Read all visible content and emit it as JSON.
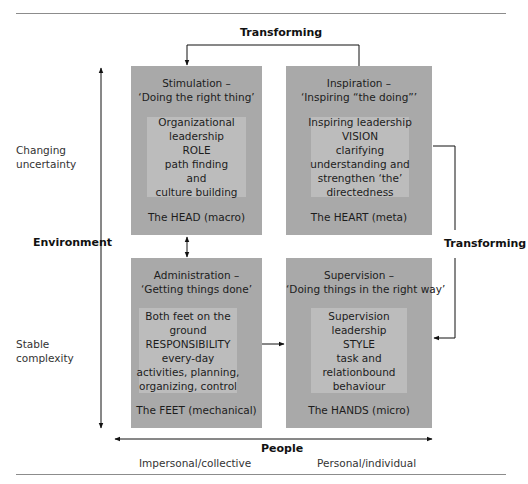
{
  "diagram": {
    "top_connector_label": "Transforming",
    "right_connector_label": "Transforming",
    "vertical_axis": {
      "label": "Environment",
      "top_label": [
        "Changing",
        "uncertainty"
      ],
      "bottom_label": [
        "Stable",
        "complexity"
      ]
    },
    "horizontal_axis": {
      "label": "People",
      "left_label": "Impersonal/collective",
      "right_label": "Personal/individual"
    },
    "quadrants": [
      {
        "id": "head",
        "title": [
          "Stimulation –",
          "‘Doing the right thing’"
        ],
        "inner": [
          "Organizational",
          "leadership",
          "ROLE",
          "path finding",
          "and",
          "culture building"
        ],
        "footer": "The HEAD (macro)"
      },
      {
        "id": "heart",
        "title": [
          "Inspiration –",
          "‘Inspiring “the doing”’"
        ],
        "inner": [
          "Inspiring leadership",
          "VISION",
          "clarifying",
          "understanding and",
          "strengthen ‘the’",
          "directedness"
        ],
        "footer": "The HEART (meta)"
      },
      {
        "id": "feet",
        "title": [
          "Administration –",
          "‘Getting things done’"
        ],
        "inner": [
          "Both feet on the",
          "ground",
          "RESPONSIBILITY",
          "every-day",
          "activities, planning,",
          "organizing, control"
        ],
        "footer": "The FEET (mechanical)"
      },
      {
        "id": "hands",
        "title": [
          "Supervision –",
          "‘Doing things in the right way’"
        ],
        "inner": [
          "Supervision",
          "leadership",
          "STYLE",
          "task and",
          "relationbound",
          "behaviour"
        ],
        "footer": "The HANDS (micro)"
      }
    ],
    "colors": {
      "quadrant_fill": "#a9a9a9",
      "inner_fill": "#bcbcbc",
      "line": "#111111",
      "rule": "#8c8c8c"
    }
  }
}
